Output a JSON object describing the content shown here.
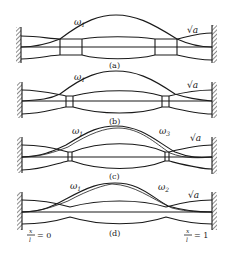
{
  "figure": {
    "panels": [
      {
        "id": "a",
        "caption": "(a)",
        "omega_left": "ω",
        "omega_left_sub": "1",
        "sqrt_label": "√a"
      },
      {
        "id": "b",
        "caption": "(b)",
        "omega_left": "ω",
        "omega_left_sub": "1",
        "sqrt_label": "√a"
      },
      {
        "id": "c",
        "caption": "(c)",
        "omega_left": "ω",
        "omega_left_sub": "1",
        "omega_right": "ω",
        "omega_right_sub": "3",
        "sqrt_label": "√a"
      },
      {
        "id": "d",
        "caption": "(d)",
        "omega_left": "ω",
        "omega_left_sub": "1",
        "omega_right": "ω",
        "omega_right_sub": "2",
        "sqrt_label": "√a"
      }
    ],
    "axis_left": {
      "num": "x",
      "den": "l",
      "eq": "= 0"
    },
    "axis_right": {
      "num": "x",
      "den": "l",
      "eq": "= 1"
    }
  }
}
